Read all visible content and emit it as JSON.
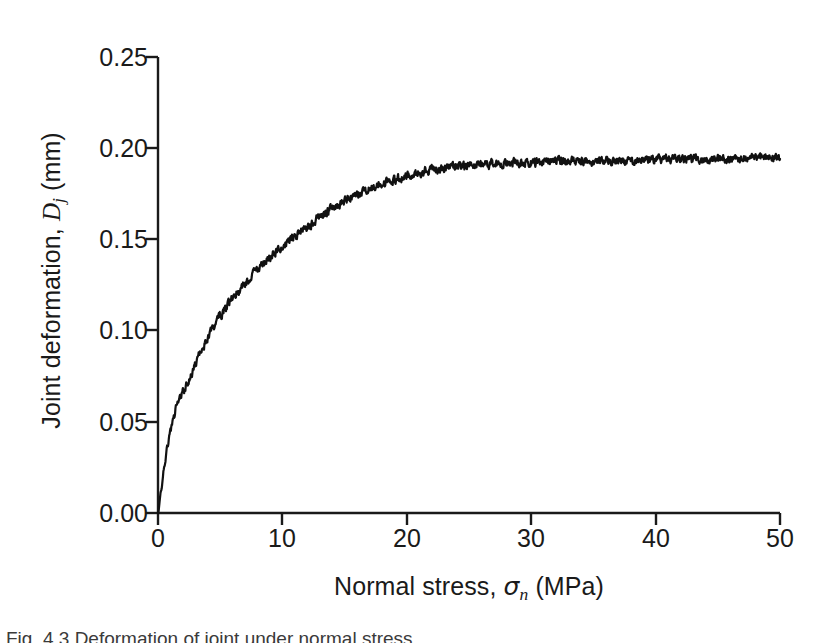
{
  "figure": {
    "background": "#ffffff",
    "ink": "#1a1a1a",
    "caption_partial": "Fig. 4.3 Deformation of joint under normal stress"
  },
  "axes": {
    "x": {
      "label_prefix": "Normal stress, ",
      "label_symbol": "σ",
      "label_subscript": "n",
      "label_suffix": " (MPa)",
      "label_full": "Normal stress, σn (MPa)",
      "ticks": [
        "0",
        "10",
        "20",
        "30",
        "40",
        "50"
      ],
      "tick_values": [
        0,
        10,
        20,
        30,
        40,
        50
      ],
      "range": [
        0,
        50
      ],
      "tick_direction": "out"
    },
    "y": {
      "label_prefix": "Joint deformation, ",
      "label_symbol": "D",
      "label_subscript": "j",
      "label_suffix": " (mm)",
      "label_full": "Joint deformation, Dj (mm)",
      "ticks": [
        "0.00",
        "0.05",
        "0.10",
        "0.15",
        "0.20",
        "0.25"
      ],
      "tick_values": [
        0.0,
        0.05,
        0.1,
        0.15,
        0.2,
        0.25
      ],
      "range": [
        0.0,
        0.25
      ],
      "tick_direction": "out"
    }
  },
  "chart_data": {
    "type": "line",
    "title": "",
    "xlabel": "Normal stress, σn (MPa)",
    "ylabel": "Joint deformation, Dj (mm)",
    "xlim": [
      0,
      50
    ],
    "ylim": [
      0,
      0.25
    ],
    "xticks": [
      0,
      10,
      20,
      30,
      40,
      50
    ],
    "yticks": [
      0.0,
      0.05,
      0.1,
      0.15,
      0.2,
      0.25
    ],
    "grid": false,
    "legend": null,
    "line_color": "#111111",
    "line_width": 2.2,
    "noise_amplitude": 0.0035,
    "asymptote": 0.193,
    "model": "hyperbolic: Dj = Vm * s / (Kni_ratio + s) with noise",
    "series": [
      {
        "name": "Joint deformation",
        "x": [
          0.0,
          0.25,
          0.5,
          0.75,
          1.0,
          1.25,
          1.5,
          1.75,
          2.0,
          2.5,
          3.0,
          3.5,
          4.0,
          4.5,
          5.0,
          5.5,
          6.0,
          6.5,
          7.0,
          7.5,
          8.0,
          8.5,
          9.0,
          9.5,
          10.0,
          11.0,
          12.0,
          13.0,
          14.0,
          15.0,
          16.0,
          17.0,
          18.0,
          19.0,
          20.0,
          22.0,
          24.0,
          26.0,
          28.0,
          30.0,
          32.0,
          34.0,
          36.0,
          38.0,
          40.0,
          42.0,
          44.0,
          46.0,
          48.0,
          50.0
        ],
        "y": [
          0.0,
          0.012,
          0.025,
          0.036,
          0.045,
          0.052,
          0.058,
          0.062,
          0.066,
          0.073,
          0.081,
          0.089,
          0.096,
          0.102,
          0.108,
          0.113,
          0.118,
          0.122,
          0.126,
          0.13,
          0.134,
          0.137,
          0.14,
          0.143,
          0.146,
          0.152,
          0.157,
          0.162,
          0.167,
          0.171,
          0.175,
          0.178,
          0.181,
          0.183,
          0.185,
          0.188,
          0.19,
          0.191,
          0.192,
          0.192,
          0.193,
          0.193,
          0.193,
          0.193,
          0.194,
          0.194,
          0.194,
          0.194,
          0.195,
          0.195
        ]
      }
    ]
  },
  "geometry": {
    "plot_left": 158,
    "plot_right": 780,
    "plot_top": 57,
    "plot_bottom": 513
  }
}
